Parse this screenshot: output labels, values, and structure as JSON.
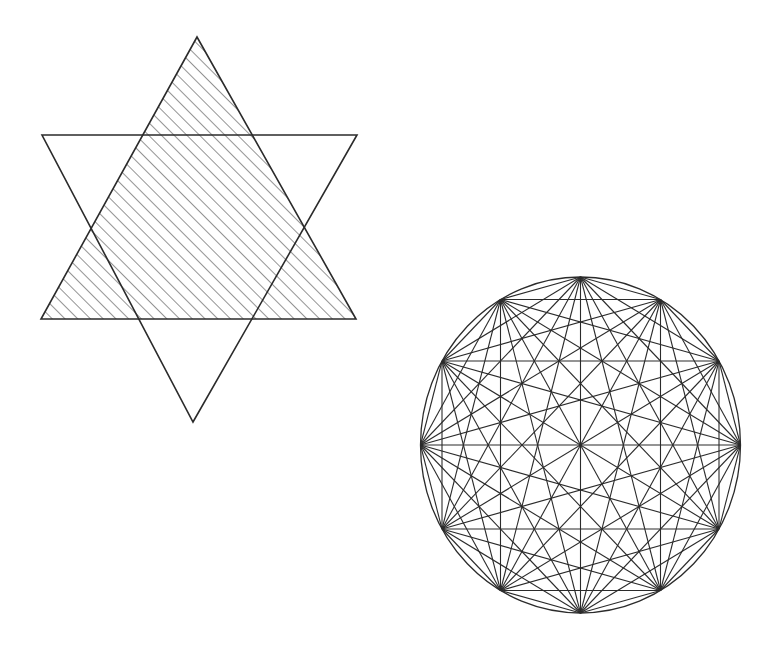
{
  "page": {
    "background_color": "#ffffff",
    "width": 783,
    "height": 661,
    "stroke_color": "#2b2b2b",
    "hatch_color": "#3a3a3a"
  },
  "figures": [
    {
      "id": "hexagram",
      "name": "hatched-hexagram",
      "label": "Hexagram of two overlapping equilateral triangles",
      "stroke_color": "#2b2b2b",
      "stroke_width": 1.6,
      "bounds": {
        "x": 40,
        "y": 36,
        "width": 318,
        "height": 387
      },
      "center": {
        "x": 199,
        "y": 229
      },
      "triangles": [
        {
          "id": "triangle-up",
          "name": "upward-triangle",
          "orientation": "up",
          "hatched": true,
          "hatch_angle_deg": 45,
          "hatch_spacing_px": 9,
          "hatch_stroke_width": 1.1,
          "vertices": [
            {
              "x": 197,
              "y": 37
            },
            {
              "x": 356,
              "y": 319
            },
            {
              "x": 41,
              "y": 319
            }
          ]
        },
        {
          "id": "triangle-down",
          "name": "downward-triangle",
          "orientation": "down",
          "hatched": false,
          "vertices": [
            {
              "x": 42,
              "y": 135
            },
            {
              "x": 357,
              "y": 135
            },
            {
              "x": 193,
              "y": 422
            }
          ]
        }
      ]
    },
    {
      "id": "dodecagon-complete-graph",
      "name": "circle-inscribed-twelve-gon",
      "label": "Circle with inscribed regular 12-gon and all diagonals",
      "stroke_color": "#2b2b2b",
      "circle_stroke_width": 1.3,
      "chord_stroke_width": 1.1,
      "circle": {
        "cx": 580.5,
        "cy": 445,
        "rx": 160,
        "ry": 168
      },
      "polygon": {
        "sides": 12,
        "start_angle_deg": -90,
        "step_angle_deg": 30,
        "all_diagonals": true,
        "chord_count": 66,
        "vertices": [
          {
            "index": 0,
            "angle_deg": -90,
            "x": 580.5,
            "y": 277.0
          },
          {
            "index": 1,
            "angle_deg": -60,
            "x": 660.5,
            "y": 299.5
          },
          {
            "index": 2,
            "angle_deg": -30,
            "x": 719.0,
            "y": 361.0
          },
          {
            "index": 3,
            "angle_deg": 0,
            "x": 740.5,
            "y": 445.0
          },
          {
            "index": 4,
            "angle_deg": 30,
            "x": 719.0,
            "y": 529.0
          },
          {
            "index": 5,
            "angle_deg": 60,
            "x": 660.5,
            "y": 590.5
          },
          {
            "index": 6,
            "angle_deg": 90,
            "x": 580.5,
            "y": 613.0
          },
          {
            "index": 7,
            "angle_deg": 120,
            "x": 500.5,
            "y": 590.5
          },
          {
            "index": 8,
            "angle_deg": 150,
            "x": 442.0,
            "y": 529.0
          },
          {
            "index": 9,
            "angle_deg": 180,
            "x": 420.5,
            "y": 445.0
          },
          {
            "index": 10,
            "angle_deg": 210,
            "x": 442.0,
            "y": 361.0
          },
          {
            "index": 11,
            "angle_deg": 240,
            "x": 500.5,
            "y": 299.5
          }
        ]
      }
    }
  ]
}
